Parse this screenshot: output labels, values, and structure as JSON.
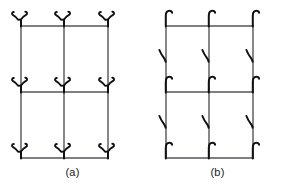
{
  "figure": {
    "background_color": "#ffffff",
    "line_color": "#55555a",
    "glyph_color": "#111111",
    "caption_color": "#1a1a1a",
    "panels": [
      {
        "id": "panel-a",
        "caption": "(a)",
        "node_glyph": "y-fork-glyph",
        "node_glyph_description": "Y-shaped fork with curled tips at each lattice node",
        "midedge_glyph": "none",
        "midedge_count": 0
      },
      {
        "id": "panel-b",
        "caption": "(b)",
        "node_glyph": "hook-glyph",
        "node_glyph_description": "J-shaped hook curving up and to the right at each lattice node",
        "midedge_glyph": "back-hook-glyph",
        "midedge_glyph_description": "small backward curving hook on the left side of each vertical edge midpoint",
        "midedge_count": 6
      }
    ],
    "grid": {
      "rows": 2,
      "cols": 2,
      "node_rows": 3,
      "node_cols": 3,
      "node_count": 9,
      "x_positions": [
        21,
        64,
        108
      ],
      "y_positions": [
        26,
        92,
        158
      ],
      "line_width": 1.4
    }
  }
}
